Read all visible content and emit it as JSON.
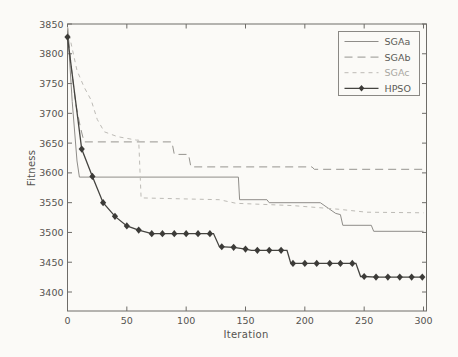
{
  "figure": {
    "background": "#fbfaf7",
    "axis_color": "#6e6c68",
    "tick_label_color": "#55534f"
  },
  "chart_data": {
    "type": "line",
    "title": "",
    "xlabel": "Iteration",
    "ylabel": "Fitness",
    "xlim": [
      0,
      300
    ],
    "ylim": [
      3368,
      3850
    ],
    "xticks": [
      0,
      50,
      100,
      150,
      200,
      250,
      300
    ],
    "yticks": [
      3400,
      3450,
      3500,
      3550,
      3600,
      3650,
      3700,
      3750,
      3800,
      3850
    ],
    "grid": false,
    "legend_position": "top-right",
    "series": [
      {
        "name": "SGAa",
        "style": "solid",
        "color": "#8f8d89",
        "width": 1,
        "points": [
          [
            0,
            3845
          ],
          [
            4,
            3720
          ],
          [
            8,
            3620
          ],
          [
            10,
            3593
          ],
          [
            144,
            3593
          ],
          [
            145,
            3555
          ],
          [
            168,
            3555
          ],
          [
            170,
            3550
          ],
          [
            213,
            3550
          ],
          [
            226,
            3532
          ],
          [
            230,
            3530
          ],
          [
            232,
            3512
          ],
          [
            256,
            3512
          ],
          [
            258,
            3502
          ],
          [
            300,
            3502
          ]
        ]
      },
      {
        "name": "SGAb",
        "style": "dashed",
        "color": "#96948f",
        "width": 1,
        "points": [
          [
            0,
            3845
          ],
          [
            3,
            3780
          ],
          [
            7,
            3715
          ],
          [
            11,
            3675
          ],
          [
            14,
            3652
          ],
          [
            88,
            3652
          ],
          [
            90,
            3631
          ],
          [
            102,
            3631
          ],
          [
            104,
            3610
          ],
          [
            206,
            3610
          ],
          [
            208,
            3606
          ],
          [
            300,
            3606
          ]
        ]
      },
      {
        "name": "SGAc",
        "style": "dash-light",
        "color": "#bdbbb6",
        "width": 1,
        "points": [
          [
            0,
            3845
          ],
          [
            8,
            3772
          ],
          [
            14,
            3744
          ],
          [
            20,
            3722
          ],
          [
            25,
            3690
          ],
          [
            31,
            3669
          ],
          [
            42,
            3661
          ],
          [
            58,
            3655
          ],
          [
            60,
            3655
          ],
          [
            62,
            3558
          ],
          [
            128,
            3555
          ],
          [
            142,
            3549
          ],
          [
            190,
            3545
          ],
          [
            228,
            3539
          ],
          [
            252,
            3534
          ],
          [
            300,
            3533
          ]
        ]
      },
      {
        "name": "HPSO",
        "style": "solid-marker",
        "color": "#454440",
        "marker_color": "#3c3b38",
        "width": 1.3,
        "marker": "diamond",
        "points": [
          [
            0,
            3828
          ],
          [
            12,
            3640
          ],
          [
            21,
            3594
          ],
          [
            30,
            3550
          ],
          [
            40,
            3527
          ],
          [
            50,
            3511
          ],
          [
            60,
            3504
          ],
          [
            71,
            3498
          ],
          [
            120,
            3498
          ],
          [
            123,
            3498
          ],
          [
            128,
            3476
          ],
          [
            140,
            3475
          ],
          [
            150,
            3472
          ],
          [
            155,
            3470
          ],
          [
            180,
            3470
          ],
          [
            185,
            3470
          ],
          [
            188,
            3449
          ],
          [
            190,
            3448
          ],
          [
            243,
            3448
          ],
          [
            247,
            3426
          ],
          [
            250,
            3426
          ],
          [
            260,
            3425
          ],
          [
            300,
            3425
          ]
        ],
        "marker_points": [
          [
            0,
            3828
          ],
          [
            12,
            3640
          ],
          [
            21,
            3594
          ],
          [
            30,
            3550
          ],
          [
            40,
            3527
          ],
          [
            50,
            3511
          ],
          [
            60,
            3504
          ],
          [
            71,
            3498
          ],
          [
            80,
            3498
          ],
          [
            90,
            3498
          ],
          [
            100,
            3498
          ],
          [
            110,
            3498
          ],
          [
            120,
            3498
          ],
          [
            130,
            3476
          ],
          [
            140,
            3475
          ],
          [
            150,
            3472
          ],
          [
            160,
            3470
          ],
          [
            170,
            3470
          ],
          [
            180,
            3470
          ],
          [
            190,
            3448
          ],
          [
            200,
            3448
          ],
          [
            210,
            3448
          ],
          [
            221,
            3448
          ],
          [
            230,
            3448
          ],
          [
            240,
            3448
          ],
          [
            250,
            3426
          ],
          [
            260,
            3425
          ],
          [
            270,
            3425
          ],
          [
            280,
            3425
          ],
          [
            290,
            3425
          ],
          [
            299,
            3425
          ]
        ]
      }
    ]
  }
}
